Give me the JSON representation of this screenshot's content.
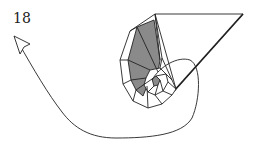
{
  "diagram": {
    "step_number": "18",
    "elements": [
      {
        "type": "step-label",
        "text": "18"
      },
      {
        "type": "arrow",
        "direction": "curving from spiral center around bottom to upper-left",
        "style": "open-head"
      },
      {
        "type": "spiral-fold",
        "description": "spiral of folded segments with shaded (gray) inner faces"
      },
      {
        "type": "triangular-flap",
        "description": "long triangular flap extending to upper right"
      }
    ],
    "colors": {
      "line": "#222222",
      "shade": "#8a8a8a",
      "background": "#ffffff"
    }
  }
}
